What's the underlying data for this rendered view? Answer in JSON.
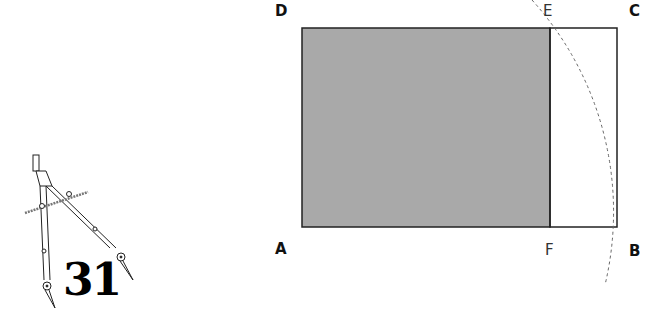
{
  "figure": {
    "number": "31",
    "points": {
      "A": "A",
      "B": "B",
      "C": "C",
      "D": "D",
      "E": "E",
      "F": "F"
    },
    "icon": "drawing-compass-icon",
    "colors": {
      "square_fill": "#a9a9a9",
      "outline": "#222222",
      "arc": "#666666"
    }
  }
}
